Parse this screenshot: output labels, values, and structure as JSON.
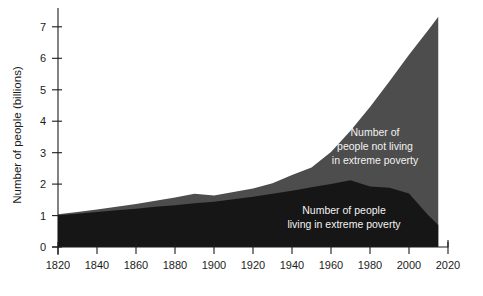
{
  "chart_data": {
    "type": "area",
    "title": "",
    "subtitle": "",
    "xlabel": "",
    "ylabel": "Number of people (billions)",
    "xlim": [
      1820,
      2020
    ],
    "ylim": [
      0,
      7.6
    ],
    "xticks": [
      1820,
      1840,
      1860,
      1880,
      1900,
      1920,
      1940,
      1960,
      1980,
      2000,
      2020
    ],
    "xtick_labels": [
      "1820",
      "1840",
      "1860",
      "1880",
      "1900",
      "1920",
      "1940",
      "1960",
      "1980",
      "2000",
      "2020"
    ],
    "yticks": [
      0,
      1,
      2,
      3,
      4,
      5,
      6,
      7
    ],
    "ytick_labels": [
      "0",
      "1",
      "2",
      "3",
      "4",
      "5",
      "6",
      "7"
    ],
    "grid": false,
    "legend_position": "inline-annotation",
    "stacked": true,
    "x": [
      1820,
      1830,
      1840,
      1850,
      1860,
      1870,
      1880,
      1890,
      1900,
      1910,
      1920,
      1930,
      1940,
      1950,
      1960,
      1970,
      1980,
      1990,
      2000,
      2010,
      2015
    ],
    "series": [
      {
        "name": "Number of people living in extreme poverty",
        "color": "#161616",
        "values": [
          1.01,
          1.06,
          1.11,
          1.17,
          1.22,
          1.28,
          1.33,
          1.39,
          1.44,
          1.52,
          1.6,
          1.69,
          1.79,
          1.9,
          2.0,
          2.12,
          1.92,
          1.88,
          1.7,
          1.0,
          0.7
        ]
      },
      {
        "name": "Number of people not living in extreme poverty",
        "color": "#4d4d4d",
        "values": [
          0.03,
          0.05,
          0.08,
          0.11,
          0.15,
          0.19,
          0.24,
          0.3,
          0.2,
          0.23,
          0.26,
          0.34,
          0.5,
          0.63,
          1.02,
          1.58,
          2.53,
          3.39,
          4.41,
          5.91,
          6.62
        ]
      }
    ],
    "total_series": {
      "name": "World population",
      "values": [
        1.04,
        1.11,
        1.19,
        1.28,
        1.37,
        1.47,
        1.57,
        1.69,
        1.64,
        1.75,
        1.86,
        2.03,
        2.29,
        2.53,
        3.02,
        3.7,
        4.45,
        5.27,
        6.11,
        6.91,
        7.32
      ]
    },
    "annotations": [
      {
        "name": "not-in-poverty-label",
        "lines": [
          "Number of",
          "people not living",
          "in extreme poverty"
        ],
        "x_px": 375,
        "y_px": 136,
        "anchor": "middle",
        "color": "#f2f2f2"
      },
      {
        "name": "in-poverty-label",
        "lines": [
          "Number of people",
          "living in extreme poverty"
        ],
        "x_px": 344,
        "y_px": 214,
        "anchor": "middle",
        "color": "#f2f2f2"
      }
    ]
  },
  "axis": {
    "y_title": "Number of people (billions)",
    "tick_color": "#1c1c1c"
  },
  "colors": {
    "background": "#ffffff",
    "poverty_band": "#161616",
    "non_poverty_band": "#4d4d4d",
    "axis": "#1c1c1c",
    "label_text": "#f2f2f2"
  }
}
